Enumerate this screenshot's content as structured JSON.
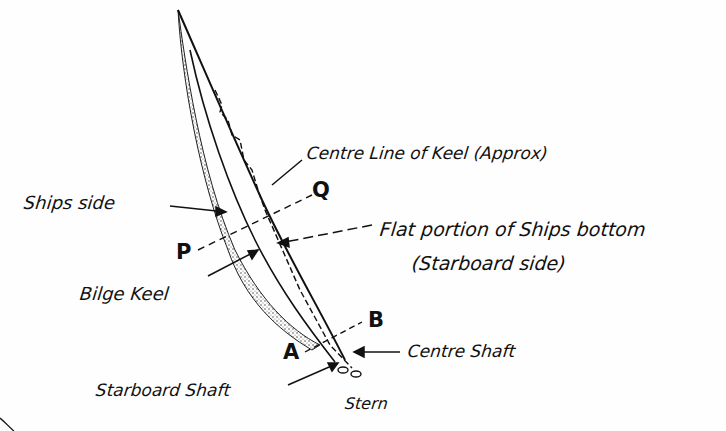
{
  "diagram": {
    "labels": {
      "centre_line": "Centre Line of Keel (Approx)",
      "ships_side": "Ships side",
      "flat_portion_line1": "Flat portion of Ships bottom",
      "flat_portion_line2": "(Starboard side)",
      "bilge_keel": "Bilge Keel",
      "centre_shaft": "Centre Shaft",
      "starboard_shaft": "Starboard Shaft",
      "stern": "Stern"
    },
    "points": {
      "p": "P",
      "q": "Q",
      "a": "A",
      "b": "B"
    },
    "colors": {
      "ink": "#111111",
      "background": "#fefefe",
      "stipple": "#555555"
    }
  }
}
